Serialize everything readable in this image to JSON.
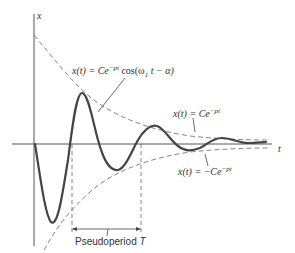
{
  "diagram": {
    "axis_x_label": "t",
    "axis_y_label": "x",
    "curve_label": {
      "lhs": "x(t) = Ce",
      "exp": "−pt",
      "rhs": " cos(ω",
      "sub": "1",
      "tail": " t − α)"
    },
    "upper_envelope_label": {
      "lhs": "x(t) = Ce",
      "exp": "−pt"
    },
    "lower_envelope_label": {
      "lhs": "x(t) = −Ce",
      "exp": "−pt"
    },
    "pseudoperiod_label": {
      "text": "Pseudoperiod ",
      "symbol": "T"
    },
    "colors": {
      "curve": "#444444",
      "axis": "#555555",
      "dashed": "#666666",
      "text": "#333333"
    }
  }
}
